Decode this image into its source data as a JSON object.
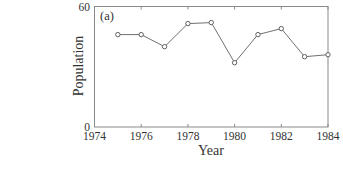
{
  "chart_data": {
    "type": "line",
    "title": "",
    "panel_label": "(a)",
    "xlabel": "Year",
    "ylabel": "Population",
    "x": [
      1975,
      1976,
      1977,
      1978,
      1979,
      1980,
      1981,
      1982,
      1983,
      1984
    ],
    "series": [
      {
        "name": "Population",
        "values": [
          46,
          46,
          40,
          51.5,
          52,
          32,
          46,
          49,
          35,
          36
        ],
        "marker": "open-circle",
        "color": "#707070"
      }
    ],
    "xlim": [
      1974,
      1984
    ],
    "ylim": [
      0,
      60
    ],
    "xticks": [
      1974,
      1976,
      1978,
      1980,
      1982,
      1984
    ],
    "xtick_labels": [
      "1974",
      "1976",
      "1978",
      "1980",
      "1982",
      "1984"
    ],
    "yticks": [
      0,
      60
    ],
    "ytick_labels": [
      "0",
      "60"
    ],
    "grid": false,
    "legend": null
  }
}
